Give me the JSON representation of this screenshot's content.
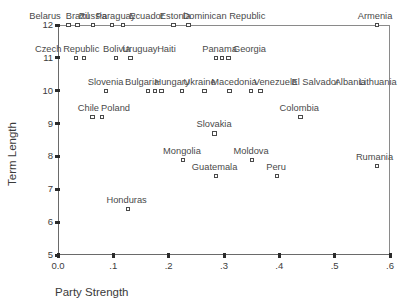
{
  "chart_data": {
    "type": "scatter",
    "title": "",
    "xlabel": "Party Strength",
    "ylabel": "Term Length",
    "xlim": [
      0.0,
      0.6
    ],
    "ylim": [
      5,
      12
    ],
    "xticks": [
      "0.0",
      ".1",
      ".2",
      ".3",
      ".4",
      ".5",
      ".6"
    ],
    "xtick_values": [
      0.0,
      0.1,
      0.2,
      0.3,
      0.4,
      0.5,
      0.6
    ],
    "yticks": [
      "12",
      "11",
      "10",
      "9",
      "8",
      "7",
      "6",
      "5"
    ],
    "ytick_values": [
      12,
      11,
      10,
      9,
      8,
      7,
      6,
      5
    ],
    "grid": false,
    "legend": "none",
    "marker_style": "open-square",
    "points": [
      {
        "label": "Belarus",
        "x": 0.019,
        "y": 12,
        "lx": 0.005,
        "ly_off": -13,
        "label_align": "left"
      },
      {
        "label": "Brazil",
        "x": 0.035,
        "y": 12,
        "lx": 0.035,
        "ly_off": -13
      },
      {
        "label": "Russia",
        "x": 0.063,
        "y": 12,
        "lx": 0.063,
        "ly_off": -13
      },
      {
        "label": "Paraguay",
        "x": 0.098,
        "y": 12,
        "lx": 0.104,
        "ly_off": -13
      },
      {
        "label": "Ecuador",
        "x": 0.117,
        "y": 12,
        "lx": 0.16,
        "ly_off": -13,
        "no_marker_label": true
      },
      {
        "label": "Estonia",
        "x": 0.209,
        "y": 12,
        "lx": 0.212,
        "ly_off": -13
      },
      {
        "label": "Dominican Republic",
        "x": 0.236,
        "y": 12,
        "lx": 0.3,
        "ly_off": -13
      },
      {
        "label": "Armenia",
        "x": 0.577,
        "y": 12,
        "lx": 0.573,
        "ly_off": -13
      },
      {
        "label": "Czech",
        "x": 0.033,
        "y": 11,
        "lx": 0.006,
        "ly_off": -13,
        "label_align": "left"
      },
      {
        "label": "Republic",
        "x": 0.047,
        "y": 11,
        "lx": 0.042,
        "ly_off": -13
      },
      {
        "label": "Bolivia",
        "x": 0.105,
        "y": 11,
        "lx": 0.106,
        "ly_off": -13
      },
      {
        "label": "Uruguay",
        "x": 0.131,
        "y": 11,
        "lx": 0.148,
        "ly_off": -13
      },
      {
        "label": "Haiti",
        "x": 0.286,
        "y": 11,
        "lx": 0.196,
        "ly_off": -13,
        "no_marker_label": true
      },
      {
        "label": "Panama",
        "x": 0.296,
        "y": 11,
        "lx": 0.292,
        "ly_off": -13
      },
      {
        "label": "Georgia",
        "x": 0.308,
        "y": 11,
        "lx": 0.346,
        "ly_off": -13,
        "no_marker_label": true
      },
      {
        "label": "Slovenia",
        "x": 0.087,
        "y": 10,
        "lx": 0.086,
        "ly_off": -13
      },
      {
        "label": "Bulgaria",
        "x": 0.163,
        "y": 10,
        "lx": 0.152,
        "ly_off": -13
      },
      {
        "label": "Hungary",
        "x": 0.175,
        "y": 10,
        "lx": 0.206,
        "ly_off": -13,
        "no_marker_label": true
      },
      {
        "label": "Ukraine",
        "x": 0.187,
        "y": 10,
        "lx": 0.256,
        "ly_off": -13,
        "no_marker_label": true
      },
      {
        "label": "Macedonia",
        "x": 0.224,
        "y": 10,
        "lx": 0.318,
        "ly_off": -13,
        "no_marker_label": true
      },
      {
        "label": "Venezuela",
        "x": 0.265,
        "y": 10,
        "lx": 0.393,
        "ly_off": -13,
        "no_marker_label": true
      },
      {
        "label": "El Salvador",
        "x": 0.31,
        "y": 10,
        "lx": 0.465,
        "ly_off": -13,
        "no_marker_label": true
      },
      {
        "label": "Albania",
        "x": 0.349,
        "y": 10,
        "lx": 0.528,
        "ly_off": -13,
        "no_marker_label": true
      },
      {
        "label": "Lithuania",
        "x": 0.366,
        "y": 10,
        "lx": 0.578,
        "ly_off": -13,
        "no_marker_label": true
      },
      {
        "label": "Chile",
        "x": 0.062,
        "y": 9.2,
        "lx": 0.055,
        "ly_off": -13
      },
      {
        "label": "Poland",
        "x": 0.08,
        "y": 9.2,
        "lx": 0.104,
        "ly_off": -13,
        "no_marker_label": true
      },
      {
        "label": "Colombia",
        "x": 0.438,
        "y": 9.2,
        "lx": 0.436,
        "ly_off": -13
      },
      {
        "label": "Slovakia",
        "x": 0.283,
        "y": 8.7,
        "lx": 0.282,
        "ly_off": -13
      },
      {
        "label": "Mongolia",
        "x": 0.226,
        "y": 7.9,
        "lx": 0.224,
        "ly_off": -13
      },
      {
        "label": "Moldova",
        "x": 0.351,
        "y": 7.9,
        "lx": 0.349,
        "ly_off": -13
      },
      {
        "label": "Rumania",
        "x": 0.577,
        "y": 7.7,
        "lx": 0.572,
        "ly_off": -13
      },
      {
        "label": "Guatemala",
        "x": 0.285,
        "y": 7.4,
        "lx": 0.283,
        "ly_off": -13
      },
      {
        "label": "Peru",
        "x": 0.396,
        "y": 7.4,
        "lx": 0.394,
        "ly_off": -13
      },
      {
        "label": "Honduras",
        "x": 0.126,
        "y": 6.4,
        "lx": 0.124,
        "ly_off": -13
      }
    ]
  }
}
